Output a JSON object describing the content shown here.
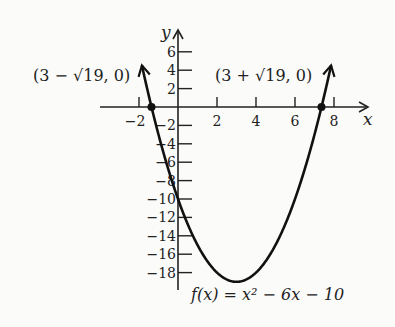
{
  "chart_data": {
    "type": "line",
    "title": "",
    "function": "f(x) = x^2 - 6x - 10",
    "function_label": "f(x) = x² − 6x − 10",
    "xlabel": "x",
    "ylabel": "y",
    "xlim": [
      -3.5,
      9.5
    ],
    "ylim": [
      -20,
      8
    ],
    "x_ticks": [
      -2,
      2,
      4,
      6,
      8
    ],
    "y_ticks": [
      6,
      4,
      2,
      -2,
      -4,
      -6,
      -8,
      -10,
      -12,
      -14,
      -16,
      -18
    ],
    "x_tick_labels": [
      "−2",
      "2",
      "4",
      "6",
      "8"
    ],
    "y_tick_labels": [
      "6",
      "4",
      "2",
      "−2",
      "−4",
      "−6",
      "−8",
      "−10",
      "−12",
      "−14",
      "−16",
      "−18"
    ],
    "grid": false,
    "vertex": {
      "x": 3,
      "y": -19
    },
    "points": [
      {
        "x": -1.3589,
        "y": 0,
        "label": "(3 − √19, 0)"
      },
      {
        "x": 7.3589,
        "y": 0,
        "label": "(3 + √19, 0)"
      }
    ],
    "series": [
      {
        "name": "f(x) = x^2 - 6x - 10",
        "x": [
          -1.9,
          -1.5,
          -1,
          -0.5,
          0,
          0.5,
          1,
          1.5,
          2,
          2.5,
          3,
          3.5,
          4,
          4.5,
          5,
          5.5,
          6,
          6.5,
          7,
          7.5,
          7.9
        ],
        "y": [
          4.0,
          1.25,
          -3,
          -6.75,
          -10,
          -12.75,
          -15,
          -16.75,
          -18,
          -18.75,
          -19,
          -18.75,
          -18,
          -16.75,
          -15,
          -12.75,
          -10,
          -6.75,
          -3,
          1.25,
          4.0
        ]
      }
    ]
  },
  "labels": {
    "x_axis": "x",
    "y_axis": "y",
    "left_root": "(3 − √19, 0)",
    "right_root": "(3 + √19, 0)",
    "function": "f(x) = x² − 6x − 10"
  }
}
